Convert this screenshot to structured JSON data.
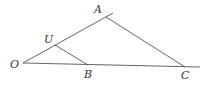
{
  "diagram": {
    "type": "geometry",
    "stroke_color": "#555555",
    "points": {
      "O": {
        "label": "O",
        "x": 23,
        "y": 63,
        "lx": 10,
        "ly": 68
      },
      "U": {
        "label": "U",
        "x": 55,
        "y": 45,
        "lx": 44,
        "ly": 43
      },
      "A": {
        "label": "A",
        "x": 106,
        "y": 17,
        "lx": 94,
        "ly": 13
      },
      "B": {
        "label": "B",
        "x": 88,
        "y": 65,
        "lx": 84,
        "ly": 78
      },
      "C": {
        "label": "C",
        "x": 185,
        "y": 67,
        "lx": 181,
        "ly": 79
      }
    },
    "segments": [
      {
        "name": "ray-OA",
        "from": [
          23,
          63
        ],
        "to": [
          113,
          13
        ]
      },
      {
        "name": "baseline-OC",
        "from": [
          23,
          63
        ],
        "to": [
          200,
          67
        ]
      },
      {
        "name": "segment-UB",
        "from": [
          55,
          45
        ],
        "to": [
          88,
          65
        ]
      },
      {
        "name": "segment-AC",
        "from": [
          106,
          17
        ],
        "to": [
          185,
          67
        ]
      }
    ]
  }
}
